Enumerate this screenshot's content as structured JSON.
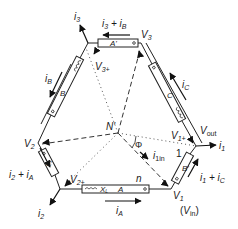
{
  "diagram": {
    "nodes": {
      "v3": "V",
      "v3_sub": "3",
      "v3plus": "V",
      "v3plus_sub": "3+",
      "v2": "V",
      "v2_sub": "2",
      "v2plus": "V",
      "v2plus_sub": "2+",
      "v1": "V",
      "v1_sub": "1",
      "v1plus": "V",
      "v1plus_sub": "1+",
      "vout": "V",
      "vout_sub": "out",
      "vin": "(V",
      "vin_sub": "in",
      "vin_close": ")",
      "neutral": "N'"
    },
    "currents": {
      "i3": "i",
      "i3_sub": "3",
      "i3_plus_iB": "i",
      "i3_plus_iB_sub1": "3",
      "i3_plus_iB_mid": " + i",
      "i3_plus_iB_sub2": "B",
      "iB": "i",
      "iB_sub": "B",
      "iC": "i",
      "iC_sub": "C",
      "i2": "i",
      "i2_sub": "2",
      "i2_plus_iA": "i",
      "i2_plus_iA_sub1": "2",
      "i2_plus_iA_mid": " + i",
      "i2_plus_iA_sub2": "A",
      "i1": "i",
      "i1_sub": "1",
      "i1_plus_iC": "i",
      "i1_plus_iC_sub1": "1",
      "i1_plus_iC_mid": " + i",
      "i1_plus_iC_sub2": "C",
      "iA": "i",
      "iA_sub": "A",
      "i1in": "i",
      "i1in_sub": "1in"
    },
    "windings": {
      "top": "A'",
      "left_upper": "B",
      "left_lower": "C",
      "right_upper": "C",
      "right_lower": "B'",
      "bottom": "A",
      "bottom_xl": "X",
      "bottom_xl_sub": "L"
    },
    "labels": {
      "phi": "Φ",
      "turns_n": "n",
      "turns_1": "1"
    }
  }
}
